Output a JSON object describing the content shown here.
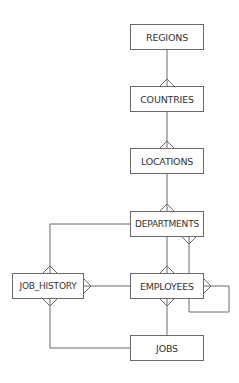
{
  "diagram": {
    "type": "entity-relationship",
    "entities": [
      {
        "id": "regions",
        "label": "REGIONS",
        "x": 130,
        "y": 24,
        "w": 74
      },
      {
        "id": "countries",
        "label": "COUNTRIES",
        "x": 130,
        "y": 86,
        "w": 74
      },
      {
        "id": "locations",
        "label": "LOCATIONS",
        "x": 130,
        "y": 148,
        "w": 74
      },
      {
        "id": "departments",
        "label": "DEPARTMENTS",
        "x": 130,
        "y": 211,
        "w": 74
      },
      {
        "id": "job_history",
        "label": "JOB_HISTORY",
        "x": 12,
        "y": 273,
        "w": 72
      },
      {
        "id": "employees",
        "label": "EMPLOYEES",
        "x": 130,
        "y": 273,
        "w": 74
      },
      {
        "id": "jobs",
        "label": "JOBS",
        "x": 130,
        "y": 335,
        "w": 74
      }
    ],
    "relationships": [
      {
        "from": "REGIONS",
        "to": "COUNTRIES",
        "cardinality": "one-to-many"
      },
      {
        "from": "COUNTRIES",
        "to": "LOCATIONS",
        "cardinality": "one-to-many"
      },
      {
        "from": "LOCATIONS",
        "to": "DEPARTMENTS",
        "cardinality": "one-to-many"
      },
      {
        "from": "DEPARTMENTS",
        "to": "EMPLOYEES",
        "cardinality": "one-to-many"
      },
      {
        "from": "EMPLOYEES",
        "to": "DEPARTMENTS",
        "cardinality": "one-to-many",
        "note": "manager"
      },
      {
        "from": "DEPARTMENTS",
        "to": "JOB_HISTORY",
        "cardinality": "one-to-many"
      },
      {
        "from": "EMPLOYEES",
        "to": "JOB_HISTORY",
        "cardinality": "one-to-many"
      },
      {
        "from": "JOBS",
        "to": "EMPLOYEES",
        "cardinality": "one-to-many"
      },
      {
        "from": "JOBS",
        "to": "JOB_HISTORY",
        "cardinality": "one-to-many"
      },
      {
        "from": "EMPLOYEES",
        "to": "EMPLOYEES",
        "cardinality": "one-to-many",
        "note": "self-reference"
      }
    ]
  }
}
